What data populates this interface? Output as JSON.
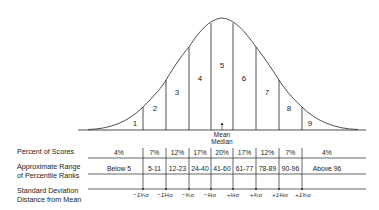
{
  "diagram": {
    "type": "normal-distribution-stanines",
    "stanines": [
      "1",
      "2",
      "3",
      "4",
      "5",
      "6",
      "7",
      "8",
      "9"
    ],
    "center_label": {
      "line1": "Mean",
      "line2": "Median"
    },
    "rows": {
      "percent": {
        "label": "Percent of Scores",
        "values": [
          "4%",
          "7%",
          "12%",
          "17%",
          "20%",
          "17%",
          "12%",
          "7%",
          "4%"
        ]
      },
      "percentile": {
        "label_line1": "Approximate Range",
        "label_line2": "of Percentile Ranks",
        "values": [
          "Below 5",
          "5-11",
          "12-23",
          "24-40",
          "41-60",
          "61-77",
          "78-89",
          "90-96",
          "Above 96"
        ]
      },
      "sd": {
        "label_line1": "Standard Deviation",
        "label_line2": "Distance from Mean",
        "values": [
          "−1¾σ",
          "−1¼σ",
          "−¾σ",
          "−¼σ",
          "+¼σ",
          "+¾σ",
          "+1¼σ",
          "+1¾σ"
        ]
      }
    }
  }
}
